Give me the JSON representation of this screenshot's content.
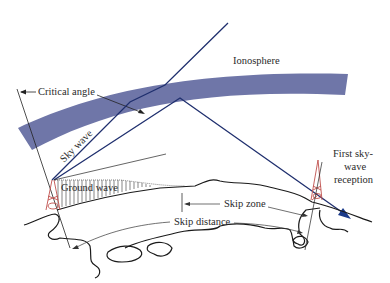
{
  "diagram": {
    "labels": {
      "ionosphere": "Ionosphere",
      "critical_angle": "Critical angle",
      "sky_wave": "Sky wave",
      "ground_wave": "Ground wave",
      "skip_zone": "Skip zone",
      "skip_distance": "Skip distance",
      "first_reception_line1": "First sky-",
      "first_reception_line2": "wave",
      "first_reception_line3": "reception"
    },
    "colors": {
      "ionosphere": "#6f76a8",
      "ray": "#1f2f6e",
      "ray_arrow": "#1a3a8a",
      "tower": "#c0504d",
      "line": "#222222"
    }
  }
}
